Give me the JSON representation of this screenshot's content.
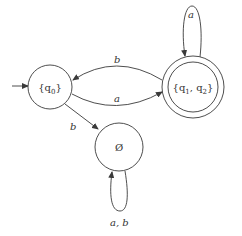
{
  "diagram": {
    "type": "DFA state diagram",
    "states": [
      {
        "id": "q0",
        "label": "{q",
        "sub": "0",
        "close": "}",
        "initial": true,
        "accepting": false
      },
      {
        "id": "q1q2",
        "label_parts": [
          "{q",
          "1",
          ", q",
          "2",
          "}"
        ],
        "initial": false,
        "accepting": true
      },
      {
        "id": "empty",
        "label": "Ø",
        "initial": false,
        "accepting": false
      }
    ],
    "transitions": [
      {
        "from": "q0",
        "to": "q1q2",
        "label": "a"
      },
      {
        "from": "q1q2",
        "to": "q0",
        "label": "b"
      },
      {
        "from": "q0",
        "to": "empty",
        "label": "b"
      },
      {
        "from": "q1q2",
        "to": "q1q2",
        "label": "a"
      },
      {
        "from": "empty",
        "to": "empty",
        "label": "a, b"
      }
    ],
    "colors": {
      "stroke": "#3a3a3a",
      "text": "#333333",
      "background": "#ffffff"
    }
  }
}
